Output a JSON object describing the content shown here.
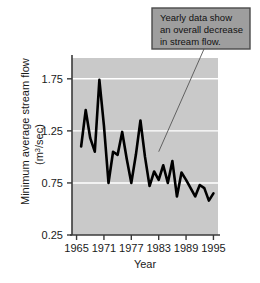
{
  "chart_data": {
    "type": "line",
    "title": "",
    "xlabel": "Year",
    "ylabel": "Minimum average stream flow (m3/sec)",
    "ylabel_main": "Minimum average stream flow",
    "ylabel_units": "(m3/sec)",
    "ylabel_units_prefix": "(m",
    "ylabel_units_sup": "3",
    "ylabel_units_suffix": "/sec)",
    "xlim": [
      1964,
      1996
    ],
    "ylim": [
      0.25,
      1.95
    ],
    "grid": true,
    "grid_orientation": "horizontal",
    "legend": "none",
    "xticks": [
      1965,
      1971,
      1977,
      1983,
      1989,
      1995
    ],
    "xtick_labels": [
      "1965",
      "1971",
      "1977",
      "1983",
      "1989",
      "1995"
    ],
    "yticks": [
      0.25,
      0.75,
      1.25,
      1.75
    ],
    "ytick_labels": [
      "0.25",
      "0.75",
      "1.25",
      "1.75"
    ],
    "gridlines": [
      0.75,
      1.25,
      1.75
    ],
    "series": [
      {
        "name": "Minimum average stream flow",
        "x": [
          1966,
          1967,
          1968,
          1969,
          1970,
          1971,
          1972,
          1973,
          1974,
          1975,
          1976,
          1977,
          1978,
          1979,
          1980,
          1981,
          1982,
          1983,
          1984,
          1985,
          1986,
          1987,
          1988,
          1989,
          1990,
          1991,
          1992,
          1993,
          1994,
          1995
        ],
        "values": [
          1.1,
          1.45,
          1.18,
          1.05,
          1.74,
          1.3,
          0.75,
          1.05,
          1.02,
          1.24,
          0.98,
          0.75,
          1.02,
          1.35,
          1.0,
          0.72,
          0.86,
          0.78,
          0.92,
          0.75,
          0.96,
          0.62,
          0.85,
          0.78,
          0.7,
          0.62,
          0.73,
          0.7,
          0.58,
          0.65
        ]
      }
    ],
    "annotation": {
      "lines": [
        "Yearly data show",
        "an overall decrease",
        "in stream flow."
      ],
      "target_x": 1983,
      "target_y": 1.05
    },
    "colors": {
      "plot_background": "#c9c9c9",
      "grid": "#ffffff",
      "line": "#000000",
      "axis": "#3a3a3a",
      "callout_fill": "#9e9e9e",
      "callout_border": "#4a4a4a",
      "leader_line": "#555555",
      "page_background": "#ffffff"
    }
  }
}
